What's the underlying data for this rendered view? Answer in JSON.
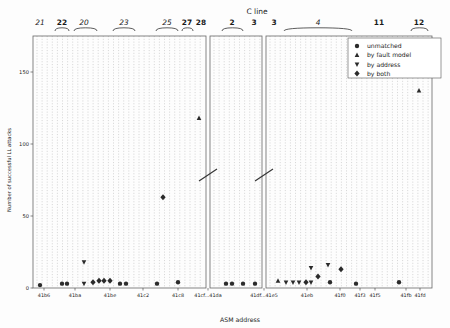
{
  "chart_data": {
    "type": "scatter",
    "title": "",
    "xlabel": "ASM address",
    "ylabel": "Number of successful LL attacks",
    "ylim": [
      0,
      175
    ],
    "yticks": [
      0,
      50,
      100,
      150
    ],
    "ytick_labels": [
      "0",
      "50",
      "100",
      "150"
    ],
    "grid": "vertical dotted gridlines per address slot",
    "legend_position": "upper right",
    "axis_breaks": 2,
    "panels": [
      {
        "id": "panel-1",
        "xtick_labels": [
          "41b6",
          "41ba",
          "41be",
          "41c2",
          "41c8",
          "41cf",
          "41da"
        ],
        "group_labels": [
          "21",
          "22",
          "20",
          "23",
          "25",
          "27",
          "28"
        ]
      },
      {
        "id": "panel-2",
        "xtick_labels": [
          "41df",
          "41e5"
        ],
        "group_labels": [
          "2",
          "3"
        ]
      },
      {
        "id": "panel-3",
        "xtick_labels": [
          "41eb",
          "41f0",
          "41f3",
          "41f5",
          "41fb",
          "41fd"
        ],
        "group_labels": [
          "3",
          "4",
          "11",
          "12"
        ]
      }
    ],
    "series": [
      {
        "name": "unmatched",
        "marker": "circle",
        "color": "#2b2b2b",
        "points": [
          {
            "x": 40,
            "y": 2
          },
          {
            "x": 62,
            "y": 3
          },
          {
            "x": 67,
            "y": 3
          },
          {
            "x": 120,
            "y": 3
          },
          {
            "x": 126,
            "y": 3
          },
          {
            "x": 157,
            "y": 3
          },
          {
            "x": 178,
            "y": 4
          },
          {
            "x": 226,
            "y": 3
          },
          {
            "x": 232,
            "y": 3
          },
          {
            "x": 243,
            "y": 3
          },
          {
            "x": 255,
            "y": 3
          },
          {
            "x": 330,
            "y": 4
          },
          {
            "x": 356,
            "y": 3
          },
          {
            "x": 399,
            "y": 4
          }
        ]
      },
      {
        "name": "by fault model",
        "marker": "triangle-up",
        "color": "#2b2b2b",
        "points": [
          {
            "x": 199,
            "y": 118
          },
          {
            "x": 278,
            "y": 5
          },
          {
            "x": 419,
            "y": 137
          }
        ]
      },
      {
        "name": "by address",
        "marker": "triangle-down",
        "color": "#2b2b2b",
        "points": [
          {
            "x": 84,
            "y": 18
          },
          {
            "x": 84,
            "y": 3
          },
          {
            "x": 286,
            "y": 4
          },
          {
            "x": 293,
            "y": 4
          },
          {
            "x": 299,
            "y": 4
          },
          {
            "x": 311,
            "y": 4
          },
          {
            "x": 311,
            "y": 14
          },
          {
            "x": 328,
            "y": 16
          }
        ]
      },
      {
        "name": "by both",
        "marker": "diamond",
        "color": "#2b2b2b",
        "points": [
          {
            "x": 93,
            "y": 4
          },
          {
            "x": 99,
            "y": 5
          },
          {
            "x": 104,
            "y": 5
          },
          {
            "x": 110,
            "y": 5
          },
          {
            "x": 163,
            "y": 63
          },
          {
            "x": 306,
            "y": 4
          },
          {
            "x": 318,
            "y": 8
          },
          {
            "x": 341,
            "y": 13
          }
        ]
      }
    ]
  },
  "legend": {
    "items": [
      {
        "label": "unmatched",
        "marker": "circle"
      },
      {
        "label": "by fault model",
        "marker": "triangle-up"
      },
      {
        "label": "by address",
        "marker": "triangle-down"
      },
      {
        "label": "by both",
        "marker": "diamond"
      }
    ]
  },
  "annotations": {
    "c_line_label": "C line",
    "top_groups": [
      {
        "label": "21",
        "x": 40,
        "bracket": false,
        "italic": true
      },
      {
        "label": "22",
        "x": 62,
        "bracket": true,
        "italic": false
      },
      {
        "label": "20",
        "x": 84,
        "bracket": true,
        "italic": true
      },
      {
        "label": "23",
        "x": 124,
        "bracket": true,
        "italic": true
      },
      {
        "label": "25",
        "x": 167,
        "bracket": true,
        "italic": true
      },
      {
        "label": "27",
        "x": 187,
        "bracket": true,
        "italic": false
      },
      {
        "label": "28",
        "x": 201,
        "bracket": false,
        "italic": false
      },
      {
        "label": "2",
        "x": 232,
        "bracket": true,
        "italic": false
      },
      {
        "label": "3",
        "x": 254,
        "bracket": false,
        "italic": false
      },
      {
        "label": "3",
        "x": 274,
        "bracket": false,
        "italic": false
      },
      {
        "label": "4",
        "x": 318,
        "bracket": true,
        "italic": true
      },
      {
        "label": "11",
        "x": 379,
        "bracket": false,
        "italic": false
      },
      {
        "label": "12",
        "x": 419,
        "bracket": true,
        "italic": false
      }
    ]
  },
  "axis": {
    "x_title": "ASM address",
    "y_title": "Number of successful LL attacks",
    "break_label_left": "41cf...41da",
    "break_label_right": "41df...41e5"
  }
}
